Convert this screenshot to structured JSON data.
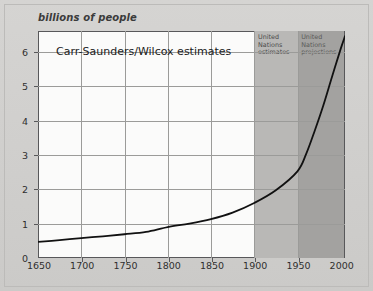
{
  "figure": {
    "y_axis_title": "billions of people",
    "chart_title": "Carr-Saunders/Wilcox estimates",
    "band_estimates_label": "United\nNations\nestimates",
    "band_estimates_line1": "United",
    "band_estimates_line2": "Nations",
    "band_estimates_line3": "estimates",
    "band_projections_line1": "United",
    "band_projections_line2": "Nations",
    "band_projections_line3": "projections"
  },
  "colors": {
    "page_background": "#d0cfcd",
    "plot_background": "#fbfbfa",
    "band_estimates": "#b9b8b6",
    "band_projections": "#a3a2a0",
    "gridline": "#9b9b99",
    "axis": "#58585a",
    "curve": "#111111",
    "text": "#2f2f2f"
  },
  "chart_data": {
    "type": "line",
    "title": "Carr-Saunders/Wilcox estimates",
    "xlabel": "",
    "ylabel": "billions of people",
    "xlim": [
      1650,
      2005
    ],
    "ylim": [
      0,
      6.6
    ],
    "grid": true,
    "legend_position": "none",
    "xticks": [
      1650,
      1700,
      1750,
      1800,
      1850,
      1900,
      1950,
      2000
    ],
    "xtick_labels": [
      "1650",
      "1700",
      "1750",
      "1800",
      "1850",
      "1900",
      "1950",
      "2000"
    ],
    "yticks": [
      0,
      1,
      2,
      3,
      4,
      5,
      6
    ],
    "ytick_labels": [
      "0",
      "1",
      "2",
      "3",
      "4",
      "5",
      "6"
    ],
    "series": [
      {
        "name": "World population",
        "x": [
          1650,
          1675,
          1700,
          1725,
          1750,
          1775,
          1800,
          1825,
          1850,
          1875,
          1900,
          1925,
          1950,
          1960,
          1970,
          1980,
          1990,
          2000,
          2005
        ],
        "values": [
          0.47,
          0.52,
          0.58,
          0.63,
          0.69,
          0.76,
          0.9,
          1.0,
          1.13,
          1.32,
          1.6,
          1.97,
          2.52,
          3.02,
          3.7,
          4.44,
          5.27,
          6.08,
          6.45
        ]
      }
    ],
    "annotations": [
      {
        "name": "band-united-nations-estimates",
        "label": "United Nations estimates",
        "x_start": 1900,
        "x_end": 1960
      },
      {
        "name": "band-united-nations-projections",
        "label": "United Nations projections",
        "x_start": 1960,
        "x_end": 2005
      }
    ]
  }
}
